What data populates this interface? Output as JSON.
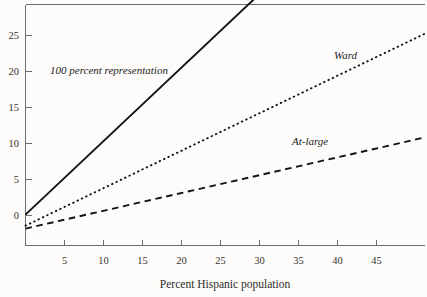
{
  "chart_data": {
    "type": "line",
    "title": "",
    "subtitle": "",
    "xlabel": "Percent Hispanic population",
    "ylabel": "",
    "xlim": [
      0,
      51.2
    ],
    "ylim": [
      -4.2,
      28.6
    ],
    "xticks": [
      5,
      10,
      15,
      20,
      25,
      30,
      35,
      40,
      45
    ],
    "yticks": [
      0,
      5,
      10,
      15,
      20,
      25
    ],
    "xticklabels": [
      "5",
      "10",
      "15",
      "20",
      "25",
      "30",
      "35",
      "40",
      "45"
    ],
    "yticklabels": [
      "0",
      "5",
      "10",
      "15",
      "20",
      "25"
    ],
    "grid": false,
    "legend_position": "inline-annotations",
    "series": [
      {
        "name": "100 percent representation",
        "style": "solid",
        "label_text": "100 percent representation",
        "x": [
          0,
          30
        ],
        "values": [
          0,
          30
        ],
        "intercept": 0,
        "slope": 1
      },
      {
        "name": "Ward",
        "style": "dotted",
        "label_text": "Ward",
        "x": [
          0,
          51.2
        ],
        "values": [
          -1.5,
          24.6
        ],
        "intercept": -1.5,
        "slope": 0.51
      },
      {
        "name": "At-large",
        "style": "dashed",
        "label_text": "At-large",
        "x": [
          0,
          51.2
        ],
        "values": [
          -1.9,
          10.5
        ],
        "intercept": -1.9,
        "slope": 0.242
      }
    ],
    "annotations": [
      {
        "text": "100 percent representation",
        "x": 4.0,
        "y": 20.1
      },
      {
        "text": "Ward",
        "x": 40.3,
        "y": 21.8
      },
      {
        "text": "At-large",
        "x": 34.2,
        "y": 11.3
      }
    ],
    "colors": {
      "line": "#131313",
      "axis": "#6e6e6e",
      "text": "#2b2b2b",
      "background": "#fdfcfa"
    }
  }
}
